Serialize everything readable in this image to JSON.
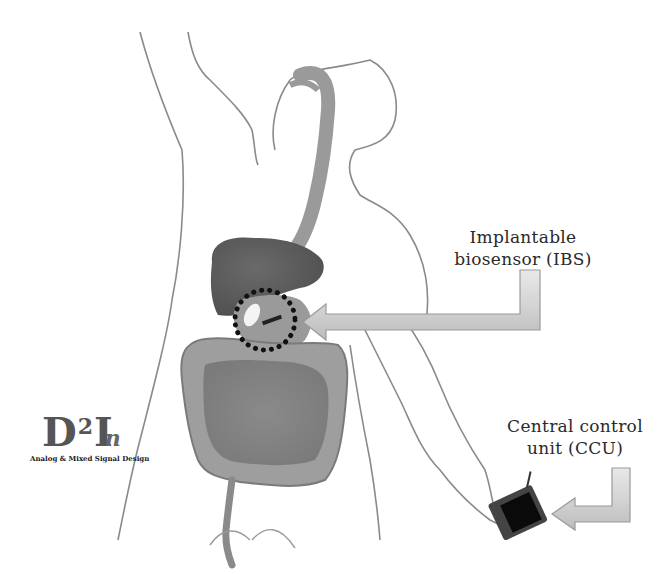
{
  "figure": {
    "type": "anatomical-diagram"
  },
  "labels": {
    "ibs": {
      "line1": "Implantable",
      "line2": "biosensor (IBS)"
    },
    "ccu": {
      "line1": "Central control",
      "line2": "unit (CCU)"
    }
  },
  "logo": {
    "main_d": "D",
    "main_sup": "2",
    "main_i": "I",
    "main_n": "n",
    "subtitle": "Analog & Mixed Signal Design"
  },
  "colors": {
    "outline": "#8a8a8a",
    "organ_dark": "#6e6e6e",
    "organ_mid": "#8c8c8c",
    "organ_light": "#b5b5b5",
    "arrow_fill": "#d0d0d0",
    "arrow_stroke": "#9a9a9a",
    "device_body": "#444444",
    "device_screen": "#0a0a0a",
    "dots": "#111111"
  }
}
